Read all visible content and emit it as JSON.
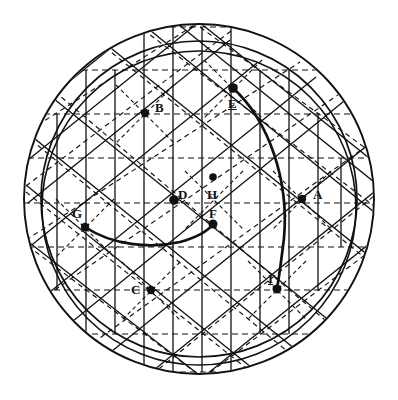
{
  "figure": {
    "style": "antique line engraving",
    "background_color": "#ffffff",
    "ink_color": "#111111",
    "canvas": {
      "width": 398,
      "height": 400
    }
  },
  "circles": [
    {
      "name": "outer-circle",
      "cx": 199,
      "cy": 199,
      "r": 175,
      "stroke": "#111111",
      "width": 1.7,
      "dash": "none"
    },
    {
      "name": "inner-circle",
      "cx": 199,
      "cy": 199,
      "r": 158,
      "stroke": "#111111",
      "width": 1.7,
      "dash": "none"
    },
    {
      "name": "upper-offset-circle",
      "cx": 199,
      "cy": 206,
      "r": 158,
      "stroke": "#111111",
      "width": 1.7,
      "dash": "none"
    }
  ],
  "arcs": [
    {
      "name": "major-arc-through-E-H-I",
      "path": "M 233 88 C 268 120 288 180 283 238 C 280 262 279 276 277 288",
      "stroke": "#111111",
      "width": 2.6
    },
    {
      "name": "minor-arc-through-G-F",
      "path": "M 85 226 C 112 244 150 248 180 241 C 198 236 208 230 213 224",
      "stroke": "#111111",
      "width": 2.6
    },
    {
      "name": "arc-upper-left-sweep",
      "path": "M 57 120 C 95 74 145 46 199 37",
      "stroke": "#111111",
      "width": 1.7
    }
  ],
  "lattice": {
    "description": "tiling of hexagram (six-pointed star) cells inside the circle",
    "rows_y": [
      27,
      70,
      114,
      158,
      203,
      247,
      290,
      334,
      372
    ],
    "solid_color": "#111111",
    "dashed_color": "#111111",
    "dash_pattern": "5,4",
    "line_width": 1.3
  },
  "points": [
    {
      "id": "A",
      "label": "A",
      "x": 302,
      "y": 199,
      "label_x": 313,
      "label_y": 188,
      "r": 4.2,
      "underline": false
    },
    {
      "id": "B",
      "label": "B",
      "x": 145,
      "y": 113,
      "label_x": 155,
      "label_y": 101,
      "r": 4.2,
      "underline": false
    },
    {
      "id": "C",
      "label": "C",
      "x": 151,
      "y": 290,
      "label_x": 131,
      "label_y": 283,
      "r": 4.2,
      "underline": false
    },
    {
      "id": "D",
      "label": "D",
      "x": 174,
      "y": 200,
      "label_x": 178,
      "label_y": 188,
      "r": 4.8,
      "underline": false
    },
    {
      "id": "E",
      "label": "E",
      "x": 233,
      "y": 88,
      "label_x": 228,
      "label_y": 97,
      "r": 4.8,
      "underline": true
    },
    {
      "id": "F",
      "label": "F",
      "x": 213,
      "y": 224,
      "label_x": 209,
      "label_y": 207,
      "r": 4.5,
      "underline": false
    },
    {
      "id": "G",
      "label": "G",
      "x": 85,
      "y": 227,
      "label_x": 72,
      "label_y": 207,
      "r": 4.2,
      "underline": false
    },
    {
      "id": "H",
      "label": "H",
      "x": 213,
      "y": 177,
      "label_x": 207,
      "label_y": 188,
      "r": 3.8,
      "underline": false
    },
    {
      "id": "I",
      "label": "I",
      "x": 277,
      "y": 289,
      "label_x": 268,
      "label_y": 272,
      "r": 4.5,
      "underline": true
    }
  ],
  "apexes": {
    "top": {
      "x": 193,
      "y": 22
    },
    "bottom": {
      "x": 203,
      "y": 378
    }
  }
}
